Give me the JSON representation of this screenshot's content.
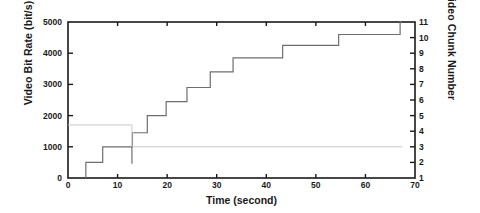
{
  "chart_data": {
    "type": "line",
    "title": "",
    "xlabel": "Time (second)",
    "ylabel": "Video Bit Rate (bit/s)",
    "y2label": "Video Chunk Number",
    "xlim": [
      0,
      70
    ],
    "ylim": [
      0,
      5000
    ],
    "y2lim": [
      1,
      11
    ],
    "grid": false,
    "legend": "none",
    "xticks": [
      0,
      10,
      20,
      30,
      40,
      50,
      60,
      70
    ],
    "xticklabels": [
      "0",
      "10",
      "20",
      "30",
      "40",
      "50",
      "60",
      "70"
    ],
    "yticks": [
      0,
      1000,
      2000,
      3000,
      4000,
      5000
    ],
    "yticklabels": [
      "0",
      "1000",
      "2000",
      "3000",
      "4000",
      "5000"
    ],
    "y2ticks": [
      1,
      2,
      3,
      4,
      5,
      6,
      7,
      8,
      9,
      10,
      11
    ],
    "y2ticklabels": [
      "1",
      "2",
      "3",
      "4",
      "5",
      "6",
      "7",
      "8",
      "9",
      "10",
      "11"
    ],
    "series": [
      {
        "name": "video-bit-rate-step",
        "drawstyle": "steps-post",
        "color": "#6e6e6e",
        "width": 1.2,
        "axis": "left",
        "x": [
          3.6,
          3.6,
          7.0,
          7.0,
          13.0,
          13.0,
          16.0,
          16.0,
          19.8,
          19.8,
          24.0,
          24.0,
          28.7,
          28.7,
          33.3,
          33.3,
          43.3,
          43.3,
          54.6,
          54.6,
          67.0,
          67.0,
          67.4
        ],
        "y": [
          0,
          500,
          500,
          1000,
          1000,
          1450,
          1450,
          2000,
          2000,
          2450,
          2450,
          2900,
          2900,
          3400,
          3400,
          3850,
          3850,
          4250,
          4250,
          4600,
          4600,
          5000,
          5000
        ]
      },
      {
        "name": "buffer-level-line",
        "drawstyle": "steps-post",
        "color": "#c8c8c8",
        "width": 1.0,
        "axis": "left",
        "x": [
          0,
          12.9,
          12.9,
          67.4
        ],
        "y": [
          1700,
          1700,
          1000,
          1000
        ]
      },
      {
        "name": "chunk-drop-marker",
        "drawstyle": "line",
        "color": "#6e6e6e",
        "width": 1.2,
        "axis": "left",
        "x": [
          12.9,
          12.9
        ],
        "y": [
          1000,
          460
        ]
      }
    ]
  },
  "axes": {
    "x_title": "Time (second)",
    "y_left_title": "Video Bit Rate (bit/s)",
    "y_right_title": "Video Chunk Number"
  }
}
